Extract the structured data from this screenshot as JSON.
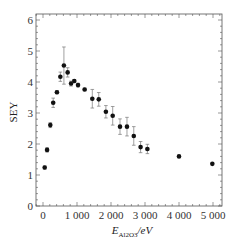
{
  "chart_data": {
    "type": "scatter",
    "title": "",
    "xlabel": "E_Al2O3/eV",
    "xlabel_parts": {
      "main": "E",
      "sub": "Al2O3",
      "unit": "/eV"
    },
    "ylabel": "SEY",
    "xlim": [
      -200,
      5200
    ],
    "ylim": [
      0,
      6.2
    ],
    "xticks": [
      0,
      1000,
      2000,
      3000,
      4000,
      5000
    ],
    "xtick_labels": [
      "0",
      "1 000",
      "2 000",
      "3 000",
      "4 000",
      "5 000"
    ],
    "yticks": [
      0,
      1,
      2,
      3,
      4,
      5,
      6
    ],
    "ytick_labels": [
      "0",
      "1",
      "2",
      "3",
      "4",
      "5",
      "6"
    ],
    "grid": false,
    "legend": null,
    "series": [
      {
        "name": "SEY",
        "marker": "circle",
        "color": "#111111",
        "points": [
          {
            "x": 50,
            "y": 1.24,
            "err": 0.05
          },
          {
            "x": 120,
            "y": 1.81,
            "err": 0.07
          },
          {
            "x": 215,
            "y": 2.61,
            "err": 0.08
          },
          {
            "x": 300,
            "y": 3.33,
            "err": 0.15
          },
          {
            "x": 410,
            "y": 3.67,
            "err": 0.05
          },
          {
            "x": 510,
            "y": 4.17,
            "err": 0.15
          },
          {
            "x": 615,
            "y": 4.53,
            "err": 0.6
          },
          {
            "x": 725,
            "y": 4.31,
            "err": 0.15
          },
          {
            "x": 825,
            "y": 3.95,
            "err": 0.08
          },
          {
            "x": 920,
            "y": 4.03,
            "err": 0.05
          },
          {
            "x": 1030,
            "y": 3.9,
            "err": 0.06
          },
          {
            "x": 1225,
            "y": 3.76,
            "err": 0.04
          },
          {
            "x": 1450,
            "y": 3.46,
            "err": 0.3
          },
          {
            "x": 1640,
            "y": 3.44,
            "err": 0.22
          },
          {
            "x": 1850,
            "y": 3.04,
            "err": 0.2
          },
          {
            "x": 2050,
            "y": 2.91,
            "err": 0.3
          },
          {
            "x": 2265,
            "y": 2.56,
            "err": 0.25
          },
          {
            "x": 2470,
            "y": 2.56,
            "err": 0.3
          },
          {
            "x": 2670,
            "y": 2.26,
            "err": 0.3
          },
          {
            "x": 2870,
            "y": 1.9,
            "err": 0.18
          },
          {
            "x": 3070,
            "y": 1.84,
            "err": 0.15
          },
          {
            "x": 4000,
            "y": 1.6,
            "err": 0.0
          },
          {
            "x": 4980,
            "y": 1.36,
            "err": 0.0
          }
        ]
      }
    ]
  },
  "layout": {
    "plot_left": 36,
    "plot_right": 222,
    "plot_top": 14,
    "plot_bottom": 206,
    "x0_px": 43,
    "px_per_1000": 34,
    "px_per_unit_y": 31
  }
}
